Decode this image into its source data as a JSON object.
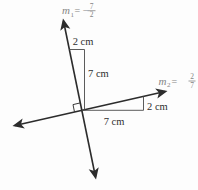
{
  "diagram": {
    "slope1": {
      "var": "m",
      "sub": "1",
      "rel": "= −",
      "num": "7",
      "den": "2"
    },
    "slope2": {
      "var": "m",
      "sub": "2",
      "rel": "=",
      "num": "2",
      "den": "7"
    },
    "measurements": {
      "upper_run": "2 cm",
      "upper_rise": "7 cm",
      "lower_run": "7 cm",
      "lower_rise": "2 cm"
    },
    "colors": {
      "line": "#2c2c2c",
      "measure_label": "#2f2f2f",
      "slope_label": "#858585",
      "background": "#fdfdfd"
    }
  }
}
